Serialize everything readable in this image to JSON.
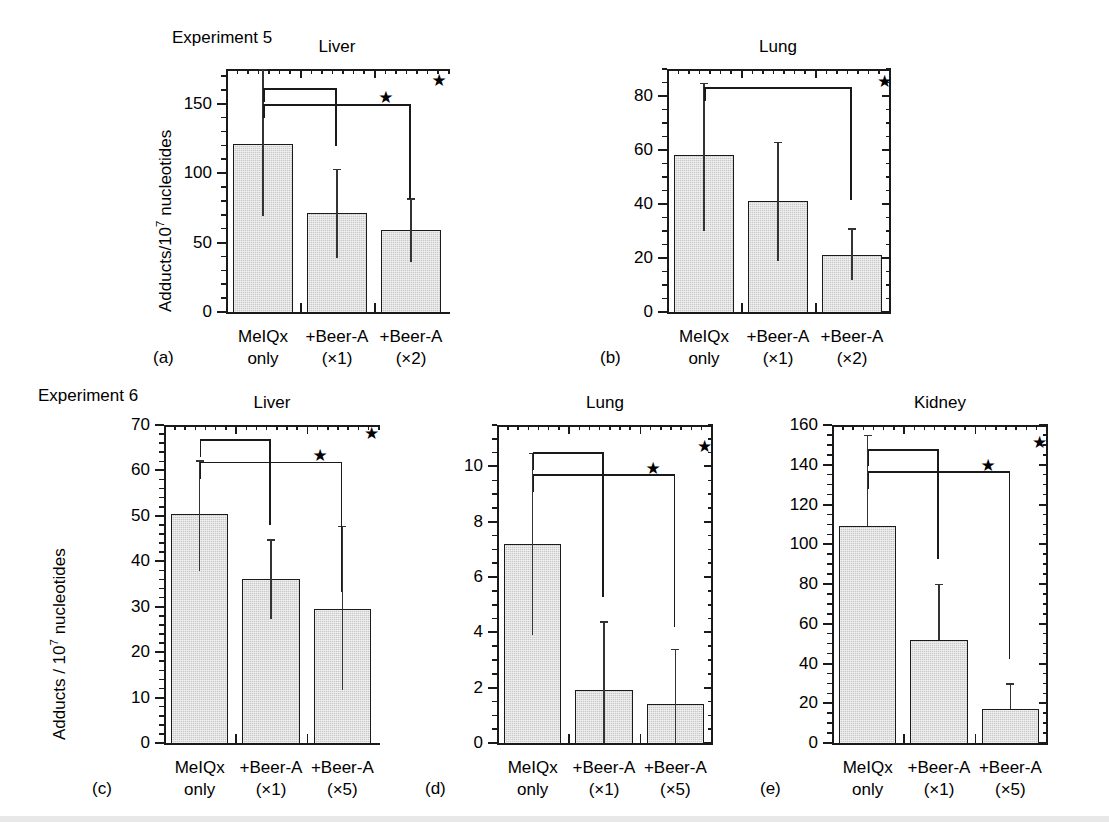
{
  "figure": {
    "rows": [
      {
        "experiment_label": "Experiment 5",
        "axis_title_prefix": "Adducts/10",
        "axis_title_exp": "7",
        "axis_title_suffix": " nucleotides"
      },
      {
        "experiment_label": "Experiment 6",
        "axis_title_prefix": "Adducts / 10",
        "axis_title_exp": "7",
        "axis_title_suffix": " nucleotides"
      }
    ],
    "star_glyph": "★"
  },
  "chart_data": [
    {
      "type": "bar",
      "panel": "a",
      "panel_label": "(a)",
      "title": "Liver",
      "group": "Experiment 5",
      "categories": [
        "MeIQx\nonly",
        "+Beer-A\n(×1)",
        "+Beer-A\n(×2)"
      ],
      "category_lines": [
        [
          "MeIQx",
          "only"
        ],
        [
          "+Beer-A",
          "(×1)"
        ],
        [
          "+Beer-A",
          "(×2)"
        ]
      ],
      "values": [
        121,
        71,
        59
      ],
      "err_low": [
        69,
        39,
        36
      ],
      "err_high": [
        175,
        103,
        82
      ],
      "ylabel": "Adducts/10⁷ nucleotides",
      "xlabel": "",
      "ylim": [
        0,
        175
      ],
      "yticks": [
        0,
        50,
        100,
        150
      ],
      "ytick_labels": [
        "0",
        "50",
        "100",
        "150"
      ],
      "minor_tick_step": 10,
      "grid": false,
      "significance": [
        {
          "from": 0,
          "to": 1,
          "label": "★"
        },
        {
          "from": 0,
          "to": 2,
          "label": "★"
        }
      ]
    },
    {
      "type": "bar",
      "panel": "b",
      "panel_label": "(b)",
      "title": "Lung",
      "group": "Experiment 5",
      "categories": [
        "MeIQx\nonly",
        "+Beer-A\n(×1)",
        "+Beer-A\n(×2)"
      ],
      "category_lines": [
        [
          "MeIQx",
          "only"
        ],
        [
          "+Beer-A",
          "(×1)"
        ],
        [
          "+Beer-A",
          "(×2)"
        ]
      ],
      "values": [
        58,
        41,
        21
      ],
      "err_low": [
        30,
        19,
        12
      ],
      "err_high": [
        85,
        63,
        31
      ],
      "ylabel": "",
      "xlabel": "",
      "ylim": [
        0,
        90
      ],
      "yticks": [
        0,
        20,
        40,
        60,
        80
      ],
      "ytick_labels": [
        "0",
        "20",
        "40",
        "60",
        "80"
      ],
      "minor_tick_step": 5,
      "grid": false,
      "significance": [
        {
          "from": 0,
          "to": 2,
          "label": "★"
        }
      ]
    },
    {
      "type": "bar",
      "panel": "c",
      "panel_label": "(c)",
      "title": "Liver",
      "group": "Experiment 6",
      "categories": [
        "MeIQx\nonly",
        "+Beer-A\n(×1)",
        "+Beer-A\n(×5)"
      ],
      "category_lines": [
        [
          "MeIQx",
          "only"
        ],
        [
          "+Beer-A",
          "(×1)"
        ],
        [
          "+Beer-A",
          "(×5)"
        ]
      ],
      "values": [
        50.4,
        36.0,
        29.6
      ],
      "err_low": [
        37.8,
        27.4,
        11.6
      ],
      "err_high": [
        62.2,
        44.8,
        47.8
      ],
      "ylabel": "Adducts / 10⁷ nucleotides",
      "xlabel": "",
      "ylim": [
        0,
        70
      ],
      "yticks": [
        0,
        10,
        20,
        30,
        40,
        50,
        60,
        70
      ],
      "ytick_labels": [
        "0",
        "10",
        "20",
        "30",
        "40",
        "50",
        "60",
        "70"
      ],
      "minor_tick_step": 2,
      "grid": false,
      "significance": [
        {
          "from": 0,
          "to": 1,
          "label": "★"
        },
        {
          "from": 0,
          "to": 2,
          "label": "★"
        }
      ]
    },
    {
      "type": "bar",
      "panel": "d",
      "panel_label": "(d)",
      "title": "Lung",
      "group": "Experiment 6",
      "categories": [
        "MeIQx\nonly",
        "+Beer-A\n(×1)",
        "+Beer-A\n(×5)"
      ],
      "category_lines": [
        [
          "MeIQx",
          "only"
        ],
        [
          "+Beer-A",
          "(×1)"
        ],
        [
          "+Beer-A",
          "(×5)"
        ]
      ],
      "values": [
        7.2,
        1.9,
        1.4
      ],
      "err_low": [
        3.9,
        0.0,
        0.0
      ],
      "err_high": [
        10.5,
        4.4,
        3.4
      ],
      "ylabel": "",
      "xlabel": "",
      "ylim": [
        0,
        11.5
      ],
      "yticks": [
        0,
        2,
        4,
        6,
        8,
        10
      ],
      "ytick_labels": [
        "0",
        "2",
        "4",
        "6",
        "8",
        "10"
      ],
      "minor_tick_step": 0.5,
      "grid": false,
      "significance": [
        {
          "from": 0,
          "to": 1,
          "label": "★"
        },
        {
          "from": 0,
          "to": 2,
          "label": "★"
        }
      ]
    },
    {
      "type": "bar",
      "panel": "e",
      "panel_label": "(e)",
      "title": "Kidney",
      "group": "Experiment 6",
      "categories": [
        "MeIQx\nonly",
        "+Beer-A\n(×1)",
        "+Beer-A\n(×5)"
      ],
      "category_lines": [
        [
          "MeIQx",
          "only"
        ],
        [
          "+Beer-A",
          "(×1)"
        ],
        [
          "+Beer-A",
          "(×5)"
        ]
      ],
      "values": [
        109,
        52,
        17
      ],
      "err_low": [
        109,
        52,
        17
      ],
      "err_high": [
        155,
        80,
        30
      ],
      "ylabel": "",
      "xlabel": "",
      "ylim": [
        0,
        160
      ],
      "yticks": [
        0,
        20,
        40,
        60,
        80,
        100,
        120,
        140,
        160
      ],
      "ytick_labels": [
        "0",
        "20",
        "40",
        "60",
        "80",
        "100",
        "120",
        "140",
        "160"
      ],
      "minor_tick_step": 5,
      "grid": false,
      "significance": [
        {
          "from": 0,
          "to": 1,
          "label": "★"
        },
        {
          "from": 0,
          "to": 2,
          "label": "★"
        }
      ]
    }
  ]
}
